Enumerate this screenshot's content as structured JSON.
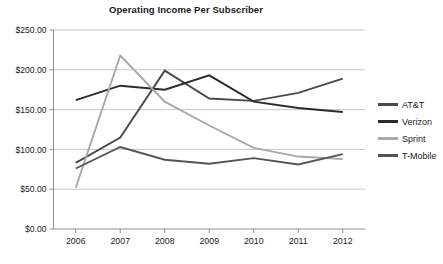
{
  "chart_data": {
    "type": "line",
    "title": "Operating Income Per Subscriber",
    "xlabel": "",
    "ylabel": "",
    "categories": [
      "2006",
      "2007",
      "2008",
      "2009",
      "2010",
      "2011",
      "2012"
    ],
    "ylim": [
      0,
      250
    ],
    "ytick_values": [
      0,
      50,
      100,
      150,
      200,
      250
    ],
    "ytick_labels": [
      "$0.00",
      "$50.00",
      "$100.00",
      "$150.00",
      "$200.00",
      "$250.00"
    ],
    "grid": true,
    "legend_position": "right",
    "series": [
      {
        "name": "AT&T",
        "color": "#4a4a4a",
        "values": [
          83,
          115,
          199,
          164,
          161,
          171,
          189
        ]
      },
      {
        "name": "Verizon",
        "color": "#2b2b2b",
        "values": [
          162,
          180,
          175,
          193,
          160,
          152,
          147
        ]
      },
      {
        "name": "Sprint",
        "color": "#a8a8a8",
        "values": [
          52,
          218,
          160,
          130,
          102,
          91,
          88
        ]
      },
      {
        "name": "T-Mobile",
        "color": "#555555",
        "values": [
          76,
          103,
          87,
          82,
          89,
          81,
          94
        ]
      }
    ]
  },
  "legend": {
    "items": [
      {
        "label": "AT&T"
      },
      {
        "label": "Verizon"
      },
      {
        "label": "Sprint"
      },
      {
        "label": "T-Mobile"
      }
    ]
  }
}
